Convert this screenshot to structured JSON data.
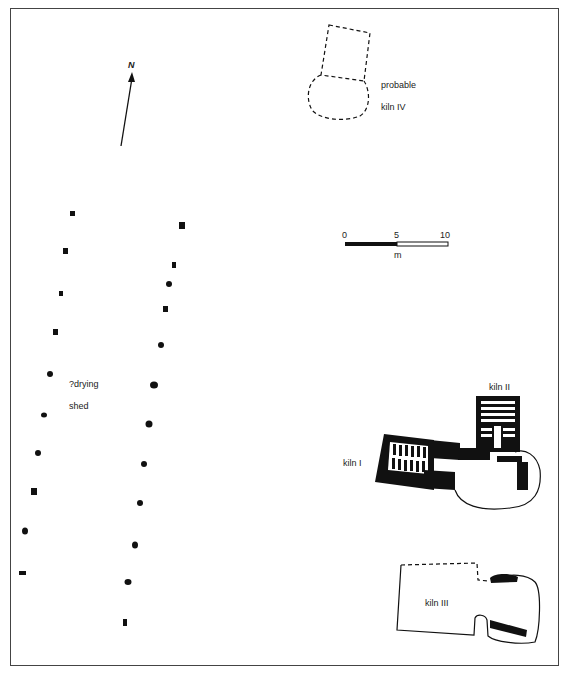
{
  "figure": {
    "type": "archaeological site plan",
    "north_arrow": {
      "label": "N"
    },
    "scale_bar": {
      "ticks": [
        "0",
        "5",
        "10"
      ],
      "unit": "m"
    },
    "features": [
      {
        "id": "kiln4",
        "label_line1": "probable",
        "label_line2": "kiln IV",
        "style": "dashed outline"
      },
      {
        "id": "kiln1",
        "label": "kiln I",
        "style": "solid black walls with flues"
      },
      {
        "id": "kiln2",
        "label": "kiln II",
        "style": "solid black walls with flues"
      },
      {
        "id": "kiln3",
        "label": "kiln III",
        "style": "outline with partial dashed edges"
      },
      {
        "id": "shed",
        "label_line1": "?drying",
        "label_line2": "shed",
        "style": "two rows of post-holes"
      }
    ],
    "post_holes": {
      "left_row": [
        [
          72,
          213
        ],
        [
          65,
          251
        ],
        [
          61,
          294
        ],
        [
          55,
          332
        ],
        [
          50,
          374
        ],
        [
          44,
          415
        ],
        [
          38,
          453
        ],
        [
          34,
          492
        ],
        [
          25,
          531
        ],
        [
          23,
          573
        ]
      ],
      "right_row": [
        [
          182,
          226
        ],
        [
          174,
          265
        ],
        [
          169,
          284
        ],
        [
          166,
          309
        ],
        [
          161,
          345
        ],
        [
          154,
          385
        ],
        [
          149,
          424
        ],
        [
          144,
          464
        ],
        [
          140,
          503
        ],
        [
          135,
          545
        ],
        [
          128,
          582
        ],
        [
          125,
          623
        ]
      ]
    },
    "colors": {
      "ink": "#111111",
      "frame": "#444444",
      "background": "#ffffff"
    }
  }
}
